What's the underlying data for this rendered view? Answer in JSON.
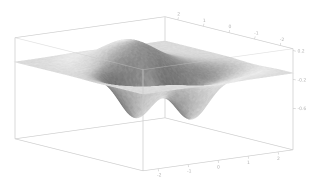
{
  "figure": {
    "kind": "3d-surface-plot",
    "background": "#ffffff"
  },
  "chart_data": {
    "type": "surface",
    "title": "",
    "axis_ranges": {
      "x": [
        -2.5,
        2.5
      ],
      "y": [
        -2.5,
        2.5
      ],
      "z": [
        -1.2,
        0.38
      ]
    },
    "x_ticks": {
      "positions": [
        0.1,
        0.3,
        0.5,
        0.7,
        0.9
      ],
      "labels": [
        "-2",
        "-1",
        "0",
        "1",
        "2"
      ]
    },
    "y_ticks": {
      "positions": [
        0.1,
        0.3,
        0.5,
        0.7,
        0.9
      ],
      "labels": [
        "-2",
        "-1",
        "0",
        "1",
        "2"
      ]
    },
    "z_ticks": {
      "positions": [
        0.35,
        -0.1,
        -0.55
      ],
      "labels": [
        "0.2",
        "-0.2",
        "-0.6"
      ]
    },
    "projection": {
      "origin": [
        143,
        94
      ],
      "u_axis": [
        150,
        -21
      ],
      "v_axis": [
        -128,
        -32
      ],
      "z_axis": [
        0,
        -64
      ]
    },
    "surface": {
      "grid": 110,
      "z_top": 0.38,
      "z_bottom": -1.2,
      "lobes": [
        {
          "u": 0.45,
          "v": 0.64,
          "amp": 0.375,
          "sigma": 0.14
        },
        {
          "u": 0.26,
          "v": 0.36,
          "amp": -0.65,
          "sigma": 0.085
        },
        {
          "u": 0.52,
          "v": 0.24,
          "amp": -0.68,
          "sigma": 0.09
        },
        {
          "u": 0.78,
          "v": 0.3,
          "amp": -0.22,
          "sigma": 0.1
        }
      ],
      "light_direction": [
        -0.25,
        0.5,
        0.83
      ],
      "shade_ambient": 0.52,
      "shade_diffuse": 0.45,
      "gray_base": 42,
      "gray_span": 198,
      "noise_jitter": 12
    },
    "colors": {
      "background": "#ffffff",
      "box_line": "#cbcbcb",
      "box_line_front": "rgba(200,200,200,0.55)",
      "tick_label": "#b4b4b4"
    },
    "legend": null,
    "grid_on": false
  }
}
